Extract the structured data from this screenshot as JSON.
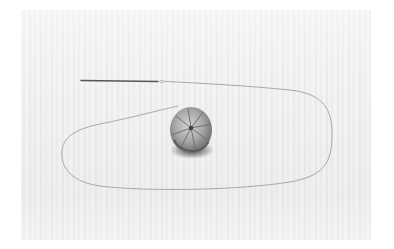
{
  "image": {
    "subject": "gathered fabric ball with needle and thread on striped cloth",
    "background_color": "#ffffff",
    "cloth_colors": [
      "#f6f6f6",
      "#e9e9e9"
    ],
    "thread_color": "#a8a8a8",
    "needle_color": "#5a5a5a",
    "ball_colors": [
      "#bdbdbd",
      "#7d7d7d",
      "#3a3a3a"
    ]
  }
}
